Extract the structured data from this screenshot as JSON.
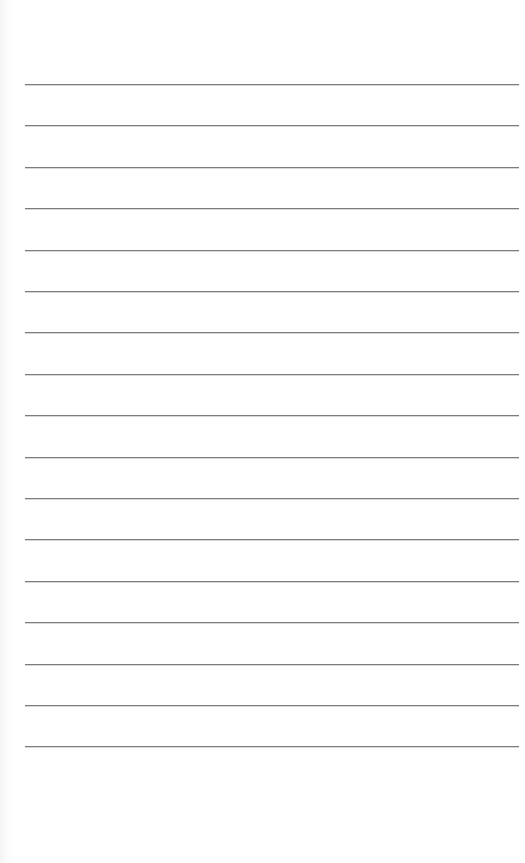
{
  "page": {
    "type": "lined-paper",
    "background_color": "#ffffff",
    "line_color": "#7d7d7d",
    "line_count": 17,
    "first_line_y": 84,
    "line_spacing": 41.4,
    "line_left": 25,
    "line_width": 494
  }
}
